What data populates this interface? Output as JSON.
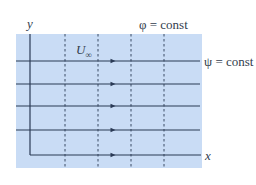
{
  "figure": {
    "colors": {
      "panel_background": "#c9dcf5",
      "line_color": "#2a3a55",
      "text_color": "#333d4d"
    },
    "labels": {
      "y_axis": "y",
      "x_axis": "x",
      "potential_lines": "φ = const",
      "streamlines": "ψ = const",
      "freestream_symbol": "U",
      "freestream_subscript": "∞"
    },
    "streamlines_y": [
      61,
      84,
      106,
      130,
      155
    ],
    "potential_lines_x": [
      65,
      98,
      131,
      164
    ],
    "arrow_x": 113
  }
}
